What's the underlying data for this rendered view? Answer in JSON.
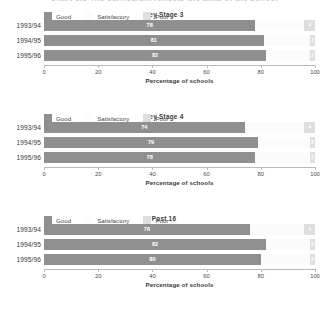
{
  "caption": "Chart 3.5  The curriculum reflects the aims of the school",
  "axis": {
    "title": "Percentage of schools",
    "ticks": [
      "0",
      "20",
      "40",
      "60",
      "80",
      "100"
    ],
    "min": 0,
    "max": 100
  },
  "legend": [
    {
      "label": "Good",
      "color": "#8f8f8f",
      "key": "good"
    },
    {
      "label": "Satisfactory",
      "color": "#fcfcfc",
      "key": "satisfactory"
    },
    {
      "label": "Poor",
      "color": "#dedede",
      "key": "poor"
    }
  ],
  "chart_data": [
    {
      "type": "bar",
      "orientation": "horizontal",
      "stacked": true,
      "title": "Key Stage 3",
      "xlabel": "Percentage of schools",
      "ylabel": "",
      "xlim": [
        0,
        100
      ],
      "grid": false,
      "legend_position": "bottom-left",
      "categories": [
        "1993/94",
        "1994/95",
        "1995/96"
      ],
      "series": [
        {
          "name": "Good",
          "values": [
            78,
            81,
            82
          ]
        },
        {
          "name": "Satisfactory",
          "values": [
            18,
            17,
            16
          ]
        },
        {
          "name": "Poor",
          "values": [
            4,
            2,
            2
          ]
        }
      ]
    },
    {
      "type": "bar",
      "orientation": "horizontal",
      "stacked": true,
      "title": "Key Stage 4",
      "xlabel": "Percentage of schools",
      "ylabel": "",
      "xlim": [
        0,
        100
      ],
      "grid": false,
      "legend_position": "bottom-left",
      "categories": [
        "1993/94",
        "1994/95",
        "1995/96"
      ],
      "series": [
        {
          "name": "Good",
          "values": [
            74,
            79,
            78
          ]
        },
        {
          "name": "Satisfactory",
          "values": [
            22,
            19,
            20
          ]
        },
        {
          "name": "Poor",
          "values": [
            4,
            2,
            2
          ]
        }
      ]
    },
    {
      "type": "bar",
      "orientation": "horizontal",
      "stacked": true,
      "title": "Post 16",
      "xlabel": "Percentage of schools",
      "ylabel": "",
      "xlim": [
        0,
        100
      ],
      "grid": false,
      "legend_position": "bottom-left",
      "categories": [
        "1993/94",
        "1994/95",
        "1995/96"
      ],
      "series": [
        {
          "name": "Good",
          "values": [
            76,
            82,
            80
          ]
        },
        {
          "name": "Satisfactory",
          "values": [
            20,
            16,
            18
          ]
        },
        {
          "name": "Poor",
          "values": [
            4,
            2,
            2
          ]
        }
      ]
    }
  ]
}
